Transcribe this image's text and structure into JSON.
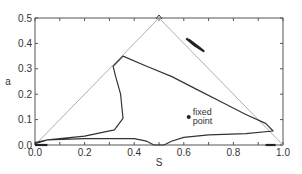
{
  "chart_data": {
    "type": "line",
    "title": "",
    "xlabel": "S",
    "ylabel": "a",
    "xlim": [
      0.0,
      1.0
    ],
    "ylim": [
      0.0,
      0.5
    ],
    "grid": false,
    "legend": null,
    "x_ticks": [
      "0.0",
      "0.2",
      "0.4",
      "0.6",
      "0.8",
      "1.0"
    ],
    "y_ticks": [
      "0.0",
      "0.1",
      "0.2",
      "0.3",
      "0.4",
      "0.5"
    ],
    "series": [
      {
        "name": "triangle boundary",
        "style": "thin-gray",
        "points": [
          [
            0.0,
            0.0
          ],
          [
            0.5,
            0.5
          ],
          [
            1.0,
            0.0
          ]
        ]
      },
      {
        "name": "main trajectory",
        "style": "solid",
        "points": [
          [
            0.0,
            0.01
          ],
          [
            0.05,
            0.02
          ],
          [
            0.2,
            0.035
          ],
          [
            0.32,
            0.06
          ],
          [
            0.355,
            0.105
          ],
          [
            0.345,
            0.2
          ],
          [
            0.325,
            0.27
          ],
          [
            0.315,
            0.31
          ],
          [
            0.355,
            0.35
          ],
          [
            0.45,
            0.31
          ],
          [
            0.55,
            0.27
          ],
          [
            0.65,
            0.22
          ],
          [
            0.75,
            0.17
          ],
          [
            0.85,
            0.12
          ],
          [
            0.93,
            0.085
          ],
          [
            0.96,
            0.055
          ],
          [
            0.85,
            0.045
          ],
          [
            0.7,
            0.04
          ],
          [
            0.6,
            0.03
          ],
          [
            0.55,
            0.015
          ],
          [
            0.52,
            0.0
          ],
          [
            0.48,
            0.0
          ],
          [
            0.45,
            0.015
          ],
          [
            0.4,
            0.025
          ],
          [
            0.2,
            0.025
          ],
          [
            0.05,
            0.02
          ],
          [
            0.0,
            0.005
          ]
        ]
      },
      {
        "name": "small loop near edge",
        "style": "thick",
        "points": [
          [
            0.61,
            0.42
          ],
          [
            0.64,
            0.395
          ],
          [
            0.68,
            0.37
          ],
          [
            0.66,
            0.385
          ],
          [
            0.62,
            0.415
          ]
        ]
      },
      {
        "name": "bottom edge segment left",
        "style": "thick",
        "points": [
          [
            0.0,
            0.0
          ],
          [
            0.05,
            0.0
          ]
        ]
      },
      {
        "name": "bottom edge segment right",
        "style": "thick",
        "points": [
          [
            0.93,
            0.0
          ],
          [
            0.97,
            0.0
          ]
        ]
      }
    ],
    "annotations": [
      {
        "text": "fixed point",
        "x": 0.62,
        "y": 0.11,
        "marker": "dot"
      }
    ]
  },
  "labels": {
    "fixed_point_line1": "fixed",
    "fixed_point_line2": "point",
    "xlabel": "S",
    "ylabel": "a",
    "x_ticks": [
      "0.0",
      "0.2",
      "0.4",
      "0.6",
      "0.8",
      "1.0"
    ],
    "y_ticks": [
      "0.0",
      "0.1",
      "0.2",
      "0.3",
      "0.4",
      "0.5"
    ]
  }
}
